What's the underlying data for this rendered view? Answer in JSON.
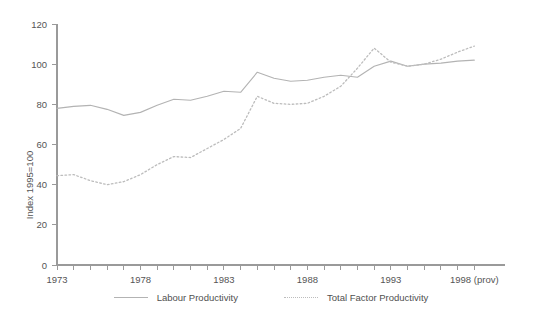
{
  "chart_data": {
    "type": "line",
    "title": "",
    "xlabel": "",
    "ylabel": "Index 1995=100",
    "xlim": [
      1973,
      1999
    ],
    "ylim": [
      0,
      120
    ],
    "grid": false,
    "legend_position": "bottom-center",
    "x": [
      1973,
      1974,
      1975,
      1976,
      1977,
      1978,
      1979,
      1980,
      1981,
      1982,
      1983,
      1984,
      1985,
      1986,
      1987,
      1988,
      1989,
      1990,
      1991,
      1992,
      1993,
      1994,
      1995,
      1996,
      1997,
      1998
    ],
    "x_tick_labels": [
      "1973",
      "1978",
      "1983",
      "1988",
      "1993",
      "1998 (prov)"
    ],
    "x_tick_values": [
      1973,
      1978,
      1983,
      1988,
      1993,
      1998
    ],
    "y_tick_labels": [
      "0",
      "20",
      "40",
      "60",
      "80",
      "100",
      "120"
    ],
    "y_tick_values": [
      0,
      20,
      40,
      60,
      80,
      100,
      120
    ],
    "series": [
      {
        "name": "Labour Productivity",
        "style": "solid",
        "color": "#b3b3b3",
        "values": [
          78.0,
          79.0,
          79.5,
          77.5,
          74.5,
          76.0,
          79.5,
          82.5,
          82.0,
          84.0,
          86.5,
          86.0,
          96.0,
          93.0,
          91.5,
          92.0,
          93.5,
          94.5,
          93.5,
          99.0,
          101.5,
          99.0,
          100.0,
          100.5,
          101.5,
          102.0
        ]
      },
      {
        "name": "Total Factor Productivity",
        "style": "dotted",
        "color": "#bcbcbc",
        "values": [
          44.5,
          45.0,
          42.0,
          40.0,
          41.5,
          45.0,
          50.0,
          54.0,
          53.5,
          58.0,
          62.5,
          68.0,
          84.0,
          80.5,
          80.0,
          80.5,
          84.0,
          89.0,
          98.0,
          108.0,
          101.0,
          99.0,
          100.0,
          102.5,
          106.0,
          109.0
        ]
      }
    ]
  },
  "legend": {
    "items": [
      {
        "label": "Labour Productivity",
        "style": "solid"
      },
      {
        "label": "Total Factor Productivity",
        "style": "dotted"
      }
    ]
  },
  "axis": {
    "y_label": "Index 1995=100"
  }
}
